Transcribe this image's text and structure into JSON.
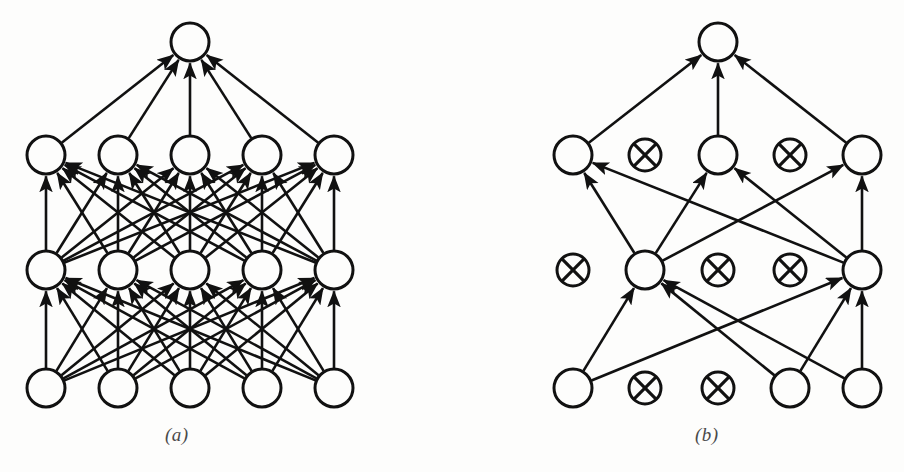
{
  "figure": {
    "background_color": "#fdfdfc",
    "ink_color": "#111111",
    "panels": [
      {
        "id": "a",
        "caption": "(a)",
        "caption_x": 165,
        "caption_y": 424,
        "description": "Standard Neural Net",
        "node_radius": 19,
        "crossed_radius": 16,
        "layers": [
          {
            "name": "input-layer",
            "y": 388,
            "nodes": [
              {
                "id": "a-in-0",
                "x": 46,
                "state": "active"
              },
              {
                "id": "a-in-1",
                "x": 118,
                "state": "active"
              },
              {
                "id": "a-in-2",
                "x": 190,
                "state": "active"
              },
              {
                "id": "a-in-3",
                "x": 262,
                "state": "active"
              },
              {
                "id": "a-in-4",
                "x": 334,
                "state": "active"
              }
            ]
          },
          {
            "name": "hidden-layer-1",
            "y": 270,
            "nodes": [
              {
                "id": "a-h1-0",
                "x": 46,
                "state": "active"
              },
              {
                "id": "a-h1-1",
                "x": 118,
                "state": "active"
              },
              {
                "id": "a-h1-2",
                "x": 190,
                "state": "active"
              },
              {
                "id": "a-h1-3",
                "x": 262,
                "state": "active"
              },
              {
                "id": "a-h1-4",
                "x": 334,
                "state": "active"
              }
            ]
          },
          {
            "name": "hidden-layer-2",
            "y": 155,
            "nodes": [
              {
                "id": "a-h2-0",
                "x": 46,
                "state": "active"
              },
              {
                "id": "a-h2-1",
                "x": 118,
                "state": "active"
              },
              {
                "id": "a-h2-2",
                "x": 190,
                "state": "active"
              },
              {
                "id": "a-h2-3",
                "x": 262,
                "state": "active"
              },
              {
                "id": "a-h2-4",
                "x": 334,
                "state": "active"
              }
            ]
          },
          {
            "name": "output-layer",
            "y": 42,
            "nodes": [
              {
                "id": "a-out-0",
                "x": 190,
                "state": "active"
              }
            ]
          }
        ],
        "edges_mode": "fully-connected",
        "edge_count": 55
      },
      {
        "id": "b",
        "caption": "(b)",
        "caption_x": 695,
        "caption_y": 424,
        "description": "After applying dropout",
        "node_radius": 19,
        "crossed_radius": 16,
        "layers": [
          {
            "name": "input-layer",
            "y": 388,
            "nodes": [
              {
                "id": "b-in-0",
                "x": 573,
                "state": "active"
              },
              {
                "id": "b-in-1",
                "x": 645,
                "state": "dropped"
              },
              {
                "id": "b-in-2",
                "x": 718,
                "state": "dropped"
              },
              {
                "id": "b-in-3",
                "x": 790,
                "state": "active"
              },
              {
                "id": "b-in-4",
                "x": 862,
                "state": "active"
              }
            ]
          },
          {
            "name": "hidden-layer-1",
            "y": 270,
            "nodes": [
              {
                "id": "b-h1-0",
                "x": 573,
                "state": "dropped"
              },
              {
                "id": "b-h1-1",
                "x": 645,
                "state": "active"
              },
              {
                "id": "b-h1-2",
                "x": 718,
                "state": "dropped"
              },
              {
                "id": "b-h1-3",
                "x": 790,
                "state": "dropped"
              },
              {
                "id": "b-h1-4",
                "x": 862,
                "state": "active"
              }
            ]
          },
          {
            "name": "hidden-layer-2",
            "y": 155,
            "nodes": [
              {
                "id": "b-h2-0",
                "x": 573,
                "state": "active"
              },
              {
                "id": "b-h2-1",
                "x": 645,
                "state": "dropped"
              },
              {
                "id": "b-h2-2",
                "x": 718,
                "state": "active"
              },
              {
                "id": "b-h2-3",
                "x": 790,
                "state": "dropped"
              },
              {
                "id": "b-h2-4",
                "x": 862,
                "state": "active"
              }
            ]
          },
          {
            "name": "output-layer",
            "y": 42,
            "nodes": [
              {
                "id": "b-out-0",
                "x": 718,
                "state": "active"
              }
            ]
          }
        ],
        "edges_mode": "thinned",
        "edge_count": 15
      }
    ]
  }
}
